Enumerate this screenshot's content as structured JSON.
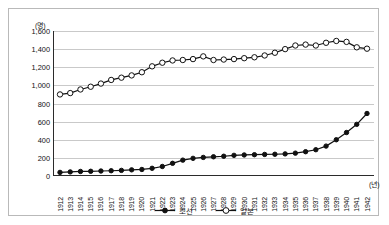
{
  "axis": {
    "y_unit": "(명)",
    "x_unit": "(년)"
  },
  "legend": [
    {
      "label": "조선",
      "marker": "filled-circle"
    },
    {
      "label": "일본",
      "marker": "open-circle"
    }
  ],
  "chart_data": {
    "type": "line",
    "title": "",
    "xlabel": "(년)",
    "ylabel": "(명)",
    "ylim": [
      0,
      1600
    ],
    "ytick_step": 200,
    "yticks": [
      "0",
      "200",
      "400",
      "600",
      "800",
      "1,000",
      "1,200",
      "1,400",
      "1,600"
    ],
    "grid": true,
    "legend_position": "bottom-center",
    "x": [
      1912,
      1913,
      1914,
      1915,
      1916,
      1917,
      1918,
      1919,
      1920,
      1921,
      1922,
      1923,
      1924,
      1925,
      1926,
      1927,
      1928,
      1929,
      1930,
      1931,
      1932,
      1933,
      1934,
      1935,
      1936,
      1937,
      1938,
      1939,
      1940,
      1941,
      1942
    ],
    "categories": [
      "1912",
      "1913",
      "1914",
      "1915",
      "1916",
      "1917",
      "1918",
      "1919",
      "1920",
      "1921",
      "1922",
      "1923",
      "1924",
      "1925",
      "1926",
      "1927",
      "1928",
      "1929",
      "1930",
      "1931",
      "1932",
      "1933",
      "1934",
      "1935",
      "1936",
      "1937",
      "1938",
      "1939",
      "1940",
      "1941",
      "1942"
    ],
    "series": [
      {
        "name": "조선",
        "marker": "filled-circle",
        "color": "#111111",
        "values": [
          40,
          45,
          50,
          52,
          55,
          58,
          62,
          68,
          72,
          85,
          105,
          140,
          175,
          195,
          205,
          212,
          218,
          228,
          232,
          235,
          238,
          240,
          244,
          252,
          268,
          290,
          330,
          400,
          480,
          570,
          690
        ]
      },
      {
        "name": "일본",
        "marker": "open-circle",
        "color": "#111111",
        "values": [
          900,
          915,
          955,
          985,
          1020,
          1060,
          1085,
          1110,
          1145,
          1210,
          1250,
          1275,
          1280,
          1290,
          1320,
          1280,
          1285,
          1290,
          1300,
          1310,
          1330,
          1360,
          1400,
          1440,
          1450,
          1440,
          1470,
          1490,
          1480,
          1420,
          1405
        ]
      }
    ]
  }
}
